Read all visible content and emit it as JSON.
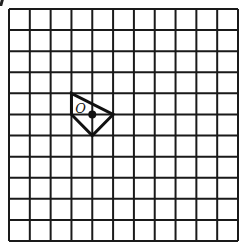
{
  "diagram": {
    "type": "square-grid",
    "rows": 11,
    "cols": 11,
    "grid": {
      "left": 9,
      "top": 9,
      "right": 238,
      "bottom": 241,
      "line_color": "#1a1a1a"
    },
    "shape": {
      "name": "quadrilateral",
      "vertices_grid": [
        [
          3,
          4
        ],
        [
          3,
          5
        ],
        [
          4,
          6
        ],
        [
          5,
          5
        ]
      ],
      "stroke_color": "#111111"
    },
    "point": {
      "label": "O",
      "grid": [
        4,
        5
      ],
      "color": "#111111"
    }
  }
}
